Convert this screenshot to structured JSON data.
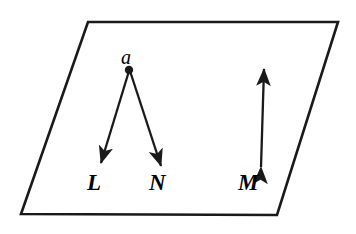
{
  "figure": {
    "background_color": "#ffffff",
    "stroke_color": "#1a1a1a",
    "plane": {
      "name": "plane-parallelogram",
      "points": "88,22 338,22 277,215 21,214",
      "stroke_width": 2.6
    },
    "point_a": {
      "label": "a",
      "label_x": 121,
      "label_y": 47,
      "dot_x": 129,
      "dot_y": 70,
      "dot_r": 4.2
    },
    "vectors": [
      {
        "name": "vector-L",
        "label": "L",
        "label_x": 87,
        "label_y": 171,
        "x1": 129,
        "y1": 71,
        "x2": 101,
        "y2": 163,
        "double_headed": false
      },
      {
        "name": "vector-N",
        "label": "N",
        "label_x": 149,
        "label_y": 171,
        "x1": 130,
        "y1": 71,
        "x2": 161,
        "y2": 166,
        "double_headed": false
      },
      {
        "name": "vector-M",
        "label": "M",
        "label_x": 238,
        "label_y": 171,
        "x1": 261,
        "y1": 167,
        "x2": 264,
        "y2": 69,
        "double_headed": true
      }
    ]
  }
}
